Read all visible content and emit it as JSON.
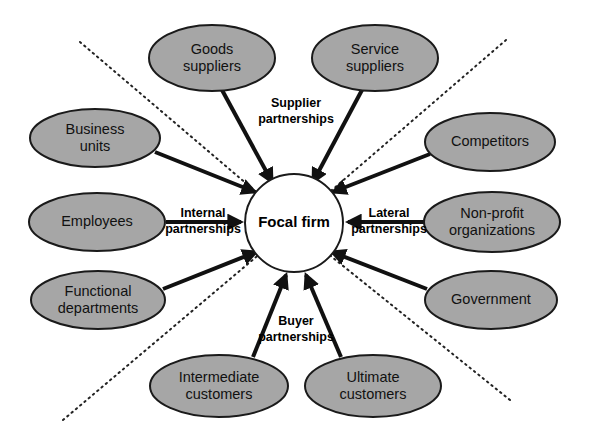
{
  "diagram": {
    "colors": {
      "node_fill": "#a6a6a6",
      "node_stroke": "#1a1a1a",
      "center_fill": "#ffffff",
      "arrow": "#111111",
      "boundary": "#222222",
      "background": "#ffffff"
    },
    "center": {
      "label": "Focal firm",
      "cx": 294,
      "cy": 223,
      "r": 49
    },
    "nodes": [
      {
        "id": "goods-suppliers",
        "lines": [
          "Goods",
          "suppliers"
        ],
        "cx": 212,
        "cy": 58,
        "rx": 63,
        "ry": 33
      },
      {
        "id": "service-suppliers",
        "lines": [
          "Service",
          "suppliers"
        ],
        "cx": 375,
        "cy": 58,
        "rx": 63,
        "ry": 33
      },
      {
        "id": "business-units",
        "lines": [
          "Business",
          "units"
        ],
        "cx": 95,
        "cy": 138,
        "rx": 65,
        "ry": 29
      },
      {
        "id": "competitors",
        "lines": [
          "Competitors"
        ],
        "cx": 490,
        "cy": 142,
        "rx": 65,
        "ry": 29
      },
      {
        "id": "employees",
        "lines": [
          "Employees"
        ],
        "cx": 97,
        "cy": 222,
        "rx": 68,
        "ry": 29
      },
      {
        "id": "non-profit-organizations",
        "lines": [
          "Non-profit",
          "organizations"
        ],
        "cx": 492,
        "cy": 222,
        "rx": 68,
        "ry": 30
      },
      {
        "id": "functional-departments",
        "lines": [
          "Functional",
          "departments"
        ],
        "cx": 98,
        "cy": 300,
        "rx": 67,
        "ry": 29
      },
      {
        "id": "government",
        "lines": [
          "Government"
        ],
        "cx": 491,
        "cy": 300,
        "rx": 66,
        "ry": 29
      },
      {
        "id": "intermediate-customers",
        "lines": [
          "Intermediate",
          "customers"
        ],
        "cx": 219,
        "cy": 386,
        "rx": 69,
        "ry": 31
      },
      {
        "id": "ultimate-customers",
        "lines": [
          "Ultimate",
          "customers"
        ],
        "cx": 373,
        "cy": 386,
        "rx": 68,
        "ry": 31
      }
    ],
    "arrows": [
      {
        "id": "arrow-goods-suppliers",
        "from": "goods-suppliers",
        "x1": 222,
        "y1": 90,
        "x2": 272,
        "y2": 182
      },
      {
        "id": "arrow-service-suppliers",
        "from": "service-suppliers",
        "x1": 362,
        "y1": 90,
        "x2": 313,
        "y2": 182
      },
      {
        "id": "arrow-business-units",
        "from": "business-units",
        "x1": 155,
        "y1": 152,
        "x2": 255,
        "y2": 192
      },
      {
        "id": "arrow-competitors",
        "from": "competitors",
        "x1": 430,
        "y1": 154,
        "x2": 333,
        "y2": 192
      },
      {
        "id": "arrow-employees",
        "from": "employees",
        "x1": 166,
        "y1": 222,
        "x2": 241,
        "y2": 222
      },
      {
        "id": "arrow-non-profit-organizations",
        "from": "non-profit-organizations",
        "x1": 424,
        "y1": 222,
        "x2": 348,
        "y2": 222
      },
      {
        "id": "arrow-functional-departments",
        "from": "functional-departments",
        "x1": 163,
        "y1": 289,
        "x2": 256,
        "y2": 252
      },
      {
        "id": "arrow-government",
        "from": "government",
        "x1": 427,
        "y1": 289,
        "x2": 332,
        "y2": 252
      },
      {
        "id": "arrow-intermediate-customers",
        "from": "intermediate-customers",
        "x1": 253,
        "y1": 357,
        "x2": 286,
        "y2": 275
      },
      {
        "id": "arrow-ultimate-customers",
        "from": "ultimate-customers",
        "x1": 341,
        "y1": 357,
        "x2": 306,
        "y2": 275
      }
    ],
    "edge_labels": [
      {
        "id": "supplier-partnerships",
        "lines": [
          "Supplier",
          "partnerships"
        ],
        "x": 296,
        "y": 112
      },
      {
        "id": "internal-partnerships",
        "lines": [
          "Internal",
          "partnerships"
        ],
        "x": 203,
        "y": 222
      },
      {
        "id": "lateral-partnerships",
        "lines": [
          "Lateral",
          "partnerships"
        ],
        "x": 389,
        "y": 222
      },
      {
        "id": "buyer-partnerships",
        "lines": [
          "Buyer",
          "partnerships"
        ],
        "x": 296,
        "y": 330
      }
    ],
    "boundaries": [
      {
        "id": "boundary-top-left",
        "x1": 80,
        "y1": 42,
        "x2": 268,
        "y2": 202
      },
      {
        "id": "boundary-top-right",
        "x1": 506,
        "y1": 40,
        "x2": 318,
        "y2": 202
      },
      {
        "id": "boundary-bottom-left",
        "x1": 63,
        "y1": 420,
        "x2": 262,
        "y2": 252
      },
      {
        "id": "boundary-bottom-right",
        "x1": 510,
        "y1": 400,
        "x2": 322,
        "y2": 249
      }
    ]
  }
}
